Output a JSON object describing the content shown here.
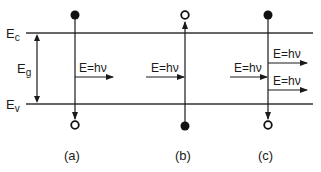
{
  "diagram": {
    "levels": {
      "conduction_band": {
        "label": "E",
        "subscript": "c"
      },
      "valence_band": {
        "label": "E",
        "subscript": "v"
      },
      "band_gap": {
        "label": "E",
        "subscript": "g"
      }
    },
    "photon_label": "E=hν",
    "panels": [
      {
        "id": "a",
        "caption": "(a)",
        "description": "Electron recombines from conduction band to valence band emitting a photon"
      },
      {
        "id": "b",
        "caption": "(b)",
        "description": "Photon absorbed, exciting electron from valence band to conduction band"
      },
      {
        "id": "c",
        "caption": "(c)",
        "description": "Incident photon stimulates emission of a second photon"
      }
    ],
    "colors": {
      "line": "#1a1a1a",
      "background": "#ffffff"
    }
  }
}
